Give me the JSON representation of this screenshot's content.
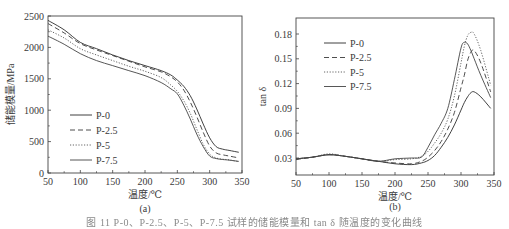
{
  "figure": {
    "caption": "图 11  P-0、P-2.5、P-5、P-7.5 试样的储能模量和 tan δ 随温度的变化曲线"
  },
  "chart_data": [
    {
      "id": "a",
      "type": "line",
      "panel_label": "(a)",
      "title": "",
      "xlabel": "温度/℃",
      "ylabel": "储能模量/MPa",
      "xlim": [
        50,
        350
      ],
      "ylim": [
        0,
        2500
      ],
      "xticks": [
        50,
        100,
        150,
        200,
        250,
        300,
        350
      ],
      "yticks": [
        0,
        500,
        1000,
        1500,
        2000,
        2500
      ],
      "grid": false,
      "legend_position": "lower left",
      "x": [
        50,
        75,
        100,
        125,
        150,
        175,
        200,
        225,
        240,
        250,
        260,
        270,
        280,
        290,
        300,
        310,
        320,
        330,
        345
      ],
      "series": [
        {
          "name": "P-0",
          "dash": "solid",
          "values": [
            2430,
            2280,
            2080,
            1980,
            1880,
            1790,
            1710,
            1630,
            1560,
            1480,
            1380,
            1230,
            1020,
            780,
            560,
            420,
            380,
            360,
            330
          ]
        },
        {
          "name": "P-2.5",
          "dash": "dashed",
          "values": [
            2380,
            2230,
            2060,
            1960,
            1870,
            1780,
            1690,
            1610,
            1530,
            1450,
            1320,
            1130,
            900,
            650,
            430,
            320,
            290,
            270,
            240
          ]
        },
        {
          "name": "P-5",
          "dash": "dotted",
          "values": [
            2280,
            2150,
            1980,
            1880,
            1790,
            1700,
            1620,
            1520,
            1400,
            1300,
            1150,
            950,
            700,
            460,
            300,
            240,
            220,
            210,
            180
          ]
        },
        {
          "name": "P-7.5",
          "dash": "solid",
          "values": [
            2180,
            2050,
            1900,
            1790,
            1710,
            1630,
            1550,
            1440,
            1340,
            1260,
            1080,
            860,
            620,
            420,
            270,
            230,
            215,
            205,
            185
          ]
        }
      ]
    },
    {
      "id": "b",
      "type": "line",
      "panel_label": "(b)",
      "title": "",
      "xlabel": "温度/℃",
      "ylabel": "tan δ",
      "xlim": [
        50,
        350
      ],
      "ylim": [
        0.01,
        0.2
      ],
      "xticks": [
        50,
        100,
        150,
        200,
        250,
        300,
        350
      ],
      "yticks": [
        0.03,
        0.06,
        0.09,
        0.12,
        0.15,
        0.18
      ],
      "grid": false,
      "legend_position": "upper left",
      "x": [
        50,
        75,
        100,
        125,
        150,
        175,
        200,
        225,
        240,
        250,
        260,
        270,
        280,
        290,
        300,
        305,
        310,
        315,
        320,
        330,
        345
      ],
      "series": [
        {
          "name": "P-0",
          "dash": "solid",
          "values": [
            0.029,
            0.031,
            0.034,
            0.032,
            0.029,
            0.026,
            0.023,
            0.022,
            0.024,
            0.027,
            0.033,
            0.043,
            0.055,
            0.07,
            0.088,
            0.097,
            0.104,
            0.109,
            0.11,
            0.104,
            0.09
          ]
        },
        {
          "name": "P-2.5",
          "dash": "dashed",
          "values": [
            0.028,
            0.031,
            0.034,
            0.032,
            0.029,
            0.026,
            0.024,
            0.023,
            0.026,
            0.031,
            0.039,
            0.05,
            0.065,
            0.085,
            0.115,
            0.13,
            0.148,
            0.158,
            0.16,
            0.145,
            0.11
          ]
        },
        {
          "name": "P-5",
          "dash": "dotted",
          "values": [
            0.029,
            0.031,
            0.035,
            0.032,
            0.029,
            0.026,
            0.028,
            0.029,
            0.032,
            0.038,
            0.048,
            0.06,
            0.077,
            0.105,
            0.145,
            0.165,
            0.178,
            0.182,
            0.18,
            0.16,
            0.118
          ]
        },
        {
          "name": "P-7.5",
          "dash": "solid",
          "values": [
            0.029,
            0.031,
            0.034,
            0.032,
            0.029,
            0.026,
            0.029,
            0.03,
            0.031,
            0.043,
            0.058,
            0.072,
            0.09,
            0.125,
            0.163,
            0.17,
            0.168,
            0.16,
            0.15,
            0.13,
            0.103
          ]
        }
      ]
    }
  ]
}
